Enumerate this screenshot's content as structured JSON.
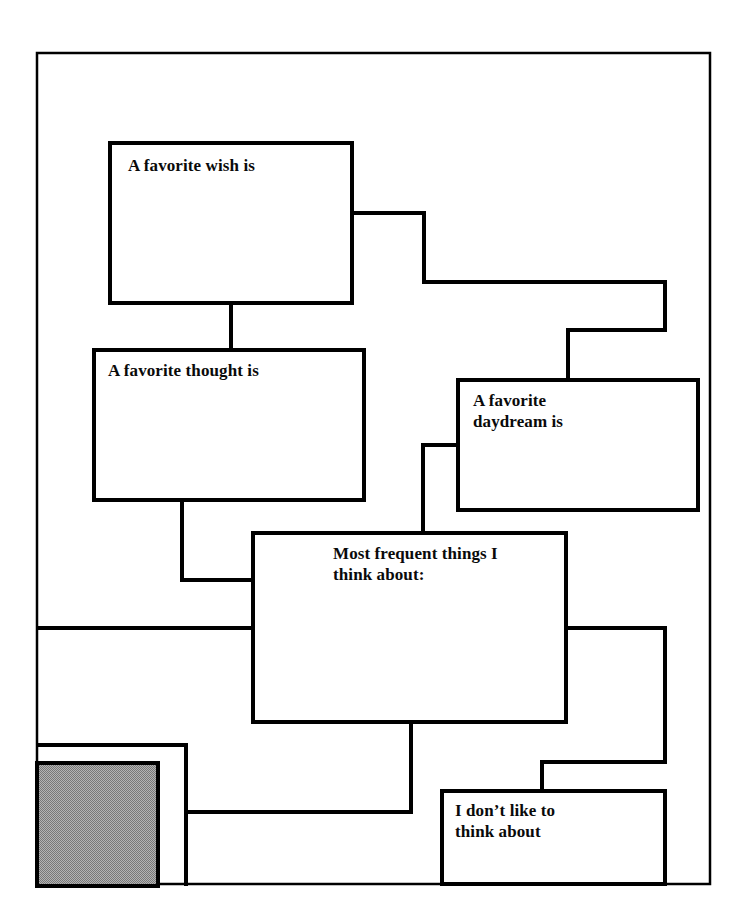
{
  "document": {
    "title": "Most frequent things I think about worksheet",
    "page_background": "#ffffff",
    "ink_color": "#000000",
    "shade_color": "#9b9b9b"
  },
  "diagram": {
    "type": "flowchart-worksheet",
    "frame": {
      "x": 37,
      "y": 53,
      "width": 673,
      "height": 831
    },
    "boxes": [
      {
        "id": "favorite-wish",
        "label": "A favorite wish is",
        "x": 110,
        "y": 143,
        "width": 242,
        "height": 160,
        "fill": "#ffffff",
        "text_offset_x": 16,
        "text_offset_y": 10
      },
      {
        "id": "favorite-thought",
        "label": "A favorite thought is",
        "x": 94,
        "y": 350,
        "width": 270,
        "height": 150,
        "fill": "#ffffff",
        "text_offset_x": 12,
        "text_offset_y": 8
      },
      {
        "id": "favorite-daydream",
        "label": "A favorite\ndaydream is",
        "x": 458,
        "y": 380,
        "width": 240,
        "height": 130,
        "fill": "#ffffff",
        "text_offset_x": 13,
        "text_offset_y": 8
      },
      {
        "id": "most-frequent-things",
        "label": "Most frequent things I\nthink about:",
        "x": 253,
        "y": 533,
        "width": 313,
        "height": 189,
        "fill": "#ffffff",
        "text_offset_x": 78,
        "text_offset_y": 9
      },
      {
        "id": "dont-like-to-think-about",
        "label": "I don’t like to\nthink about",
        "x": 442,
        "y": 791,
        "width": 223,
        "height": 93,
        "fill": "#ffffff",
        "text_offset_x": 11,
        "text_offset_y": 7
      }
    ],
    "shaded_panel": {
      "id": "shaded-panel",
      "label": "",
      "x": 37,
      "y": 763,
      "width": 121,
      "height": 121,
      "fill": "#9b9b9b"
    },
    "outer_panel": {
      "id": "outer-panel",
      "x": 37,
      "y": 745,
      "width": 149,
      "height": 139
    },
    "connectors": [
      {
        "id": "wish-to-thought",
        "points": "231,303 231,350"
      },
      {
        "id": "wish-to-daydream",
        "points": "352,213 424,213 424,282 665,282 665,330 568,330 568,380"
      },
      {
        "id": "thought-to-center",
        "points": "182,500 182,580 253,580"
      },
      {
        "id": "daydream-to-center",
        "points": "458,445 423,445 423,533"
      },
      {
        "id": "left-edge-to-center",
        "points": "37,628 253,628"
      },
      {
        "id": "center-to-dont-like",
        "points": "566,628 665,628 665,762 542,762 542,791"
      },
      {
        "id": "center-to-lower-left",
        "points": "411,722 411,812 186,812"
      }
    ]
  }
}
